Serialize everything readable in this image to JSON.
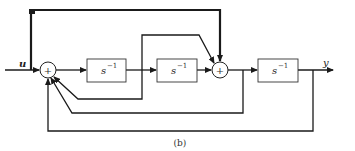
{
  "diagram": {
    "input_label": "u",
    "output_label": "y",
    "caption": "(b)",
    "summing_junctions": [
      {
        "id": "sum1",
        "sign": "+"
      },
      {
        "id": "sum2",
        "sign": "+"
      }
    ],
    "blocks": [
      {
        "id": "integrator-1",
        "label": "s",
        "exponent": "−1"
      },
      {
        "id": "integrator-2",
        "label": "s",
        "exponent": "−1"
      },
      {
        "id": "integrator-3",
        "label": "s",
        "exponent": "−1"
      }
    ],
    "colors": {
      "line": "#1a1a1a",
      "background": "#ffffff"
    }
  }
}
